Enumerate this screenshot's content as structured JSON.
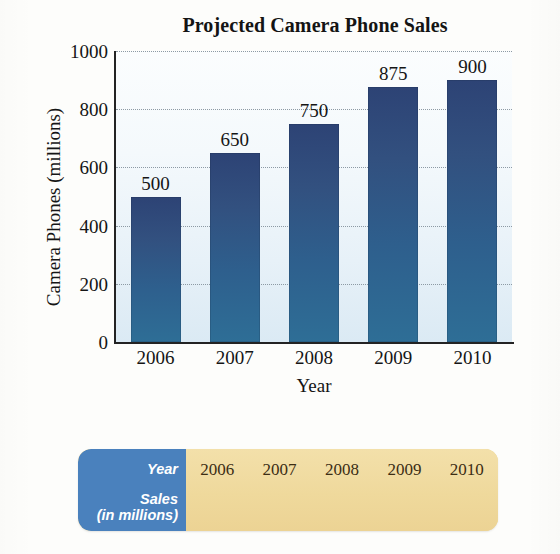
{
  "chart_data": {
    "type": "bar",
    "title": "Projected Camera Phone Sales",
    "xlabel": "Year",
    "ylabel": "Camera Phones (millions)",
    "categories": [
      "2006",
      "2007",
      "2008",
      "2009",
      "2010"
    ],
    "values": [
      500,
      650,
      750,
      875,
      900
    ],
    "value_labels": [
      "500",
      "650",
      "750",
      "875",
      "900"
    ],
    "ylim": [
      0,
      1000
    ],
    "yticks": [
      0,
      200,
      400,
      600,
      800,
      1000
    ],
    "ytick_labels": [
      "0",
      "200",
      "400",
      "600",
      "800",
      "1000"
    ],
    "grid": "horizontal-dotted",
    "legend": "none",
    "bar_color": "#2e5685",
    "plot_background": "#eaf3fa"
  },
  "table": {
    "row_labels": {
      "year": "Year",
      "sales_line1": "Sales",
      "sales_line2": "(in millions)"
    },
    "years": [
      "2006",
      "2007",
      "2008",
      "2009",
      "2010"
    ],
    "sales": [
      "",
      "",
      "",
      "",
      ""
    ],
    "label_column_color": "#4a81bd",
    "value_column_color": "#f0dba0"
  }
}
